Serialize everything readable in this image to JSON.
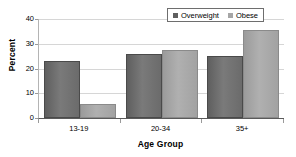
{
  "chart_data": {
    "type": "bar",
    "title": "",
    "xlabel": "Age Group",
    "ylabel": "Percent",
    "categories": [
      "13-19",
      "20-34",
      "35+"
    ],
    "series": [
      {
        "name": "Overweight",
        "color": "#6b6b6b",
        "values": [
          23,
          25.8,
          25
        ]
      },
      {
        "name": "Obese",
        "color": "#a6a6a6",
        "values": [
          5.6,
          27.4,
          35.4
        ]
      }
    ],
    "ylim": [
      0,
      40
    ],
    "yticks": [
      0,
      10,
      20,
      30,
      40
    ],
    "ytick_labels": [
      "0",
      "10",
      "20",
      "30",
      "40"
    ],
    "grid": true,
    "legend_position": "top-right"
  },
  "legend": {
    "entries": [
      {
        "label": "Overweight",
        "swatch": "overweight"
      },
      {
        "label": "Obese",
        "swatch": "obese"
      }
    ]
  }
}
